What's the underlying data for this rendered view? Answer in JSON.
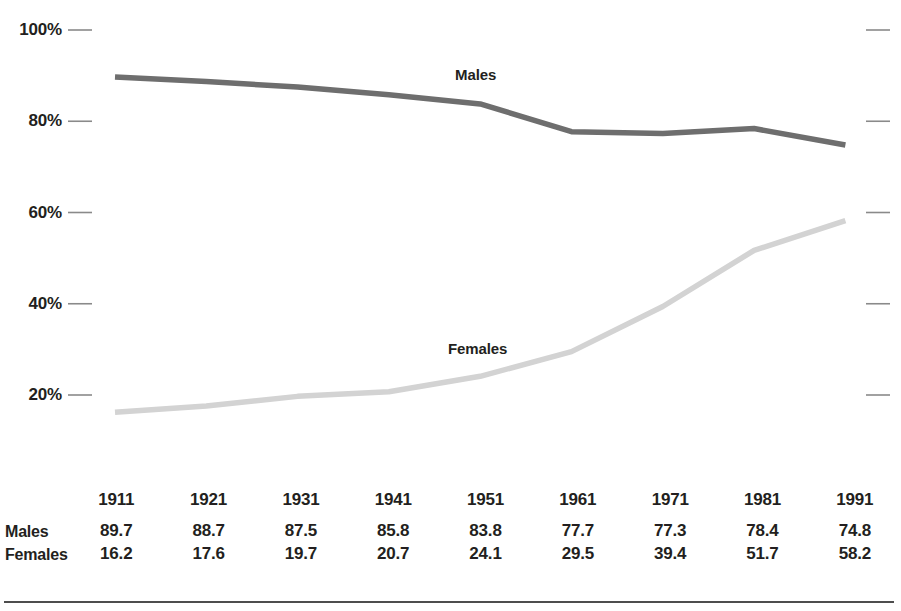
{
  "chart_data": {
    "type": "line",
    "title": "",
    "subtitle": "",
    "xlabel": "",
    "ylabel": "",
    "categories": [
      "1911",
      "1921",
      "1931",
      "1941",
      "1951",
      "1961",
      "1971",
      "1981",
      "1991"
    ],
    "series": [
      {
        "name": "Males",
        "color": "#6e6e6e",
        "values": [
          89.7,
          88.7,
          87.5,
          85.8,
          83.8,
          77.7,
          77.3,
          78.4,
          74.8
        ],
        "inline_label": "Males"
      },
      {
        "name": "Females",
        "color": "#d3d3d3",
        "values": [
          16.2,
          17.6,
          19.7,
          20.7,
          24.1,
          29.5,
          39.4,
          51.7,
          58.2
        ],
        "inline_label": "Females"
      }
    ],
    "ylim": [
      20,
      100
    ],
    "ytick_values": [
      100,
      80,
      60,
      40,
      20
    ],
    "ytick_labels": [
      "100%",
      "80%",
      "60%",
      "40%",
      "20%"
    ],
    "grid": false,
    "legend": "inline-annotations",
    "axis_line_color": "#6d6d6d",
    "tick_color": "#8a8a8a"
  },
  "table": {
    "year_header": [
      "1911",
      "1921",
      "1931",
      "1941",
      "1951",
      "1961",
      "1971",
      "1981",
      "1991"
    ],
    "rows": [
      {
        "label": "Males",
        "values": [
          "89.7",
          "88.7",
          "87.5",
          "85.8",
          "83.8",
          "77.7",
          "77.3",
          "78.4",
          "74.8"
        ]
      },
      {
        "label": "Females",
        "values": [
          "16.2",
          "17.6",
          "19.7",
          "20.7",
          "24.1",
          "29.5",
          "39.4",
          "51.7",
          "58.2"
        ]
      }
    ]
  }
}
